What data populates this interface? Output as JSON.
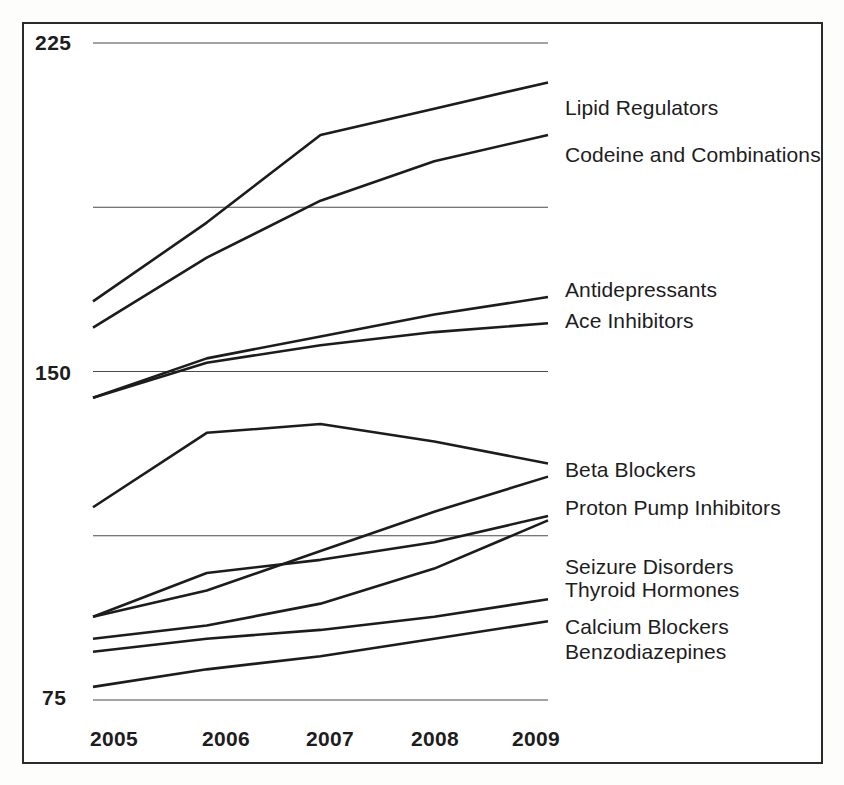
{
  "chart_data": {
    "type": "line",
    "title": "",
    "subtitle": "",
    "xlabel": "",
    "ylabel": "",
    "x": [
      2005,
      2006,
      2007,
      2008,
      2009
    ],
    "categories": [
      "2005",
      "2006",
      "2007",
      "2008",
      "2009"
    ],
    "xtick_labels": [
      "2005",
      "2006",
      "2007",
      "2008",
      "2009"
    ],
    "ytick_labels": [
      "225",
      "150",
      "75"
    ],
    "ytick_values": [
      225,
      150,
      75
    ],
    "gridline_values": [
      225,
      187.5,
      150,
      112.5,
      75
    ],
    "ylim": [
      68,
      232
    ],
    "xlim": [
      2005,
      2009
    ],
    "grid": "horizontal",
    "legend_position": "right-inline-labels",
    "series": [
      {
        "name": "Lipid Regulators",
        "label": "Lipid Regulators",
        "values": [
          166,
          184,
          204,
          210,
          216
        ]
      },
      {
        "name": "Codeine and Combinations",
        "label": "Codeine and Combinations",
        "values": [
          160,
          176,
          189,
          198,
          204
        ]
      },
      {
        "name": "Antidepressants",
        "label": "Antidepressants",
        "values": [
          144,
          153,
          158,
          163,
          167
        ]
      },
      {
        "name": "Ace Inhibitors",
        "label": "Ace Inhibitors",
        "values": [
          144,
          152,
          156,
          159,
          161
        ]
      },
      {
        "name": "Beta Blockers",
        "label": "Beta Blockers",
        "values": [
          119,
          136,
          138,
          134,
          129
        ]
      },
      {
        "name": "Proton Pump Inhibitors",
        "label": "Proton Pump Inhibitors",
        "values": [
          94,
          100,
          109,
          118,
          126
        ]
      },
      {
        "name": "Seizure Disorders",
        "label": "Seizure Disorders",
        "values": [
          94,
          104,
          107,
          111,
          117
        ]
      },
      {
        "name": "Thyroid Hormones",
        "label": "Thyroid Hormones",
        "values": [
          89,
          92,
          97,
          105,
          116
        ]
      },
      {
        "name": "Calcium Blockers",
        "label": "Calcium Blockers",
        "values": [
          86,
          89,
          91,
          94,
          98
        ]
      },
      {
        "name": "Benzodiazepines",
        "label": "Benzodiazepines",
        "values": [
          78,
          82,
          85,
          89,
          93
        ]
      }
    ]
  },
  "axis": {
    "y": {
      "ticks": [
        {
          "label": "225",
          "value": 225
        },
        {
          "label": "150",
          "value": 150
        },
        {
          "label": "75",
          "value": 75
        }
      ]
    },
    "x": {
      "ticks": [
        {
          "label": "2005"
        },
        {
          "label": "2006"
        },
        {
          "label": "2007"
        },
        {
          "label": "2008"
        },
        {
          "label": "2009"
        }
      ]
    }
  },
  "colors": {
    "line": "#1c1c1c",
    "gridline": "#4a4a4a",
    "frame_border": "#2b2b2b",
    "text": "#1d1d1d",
    "background": "#ffffff"
  }
}
